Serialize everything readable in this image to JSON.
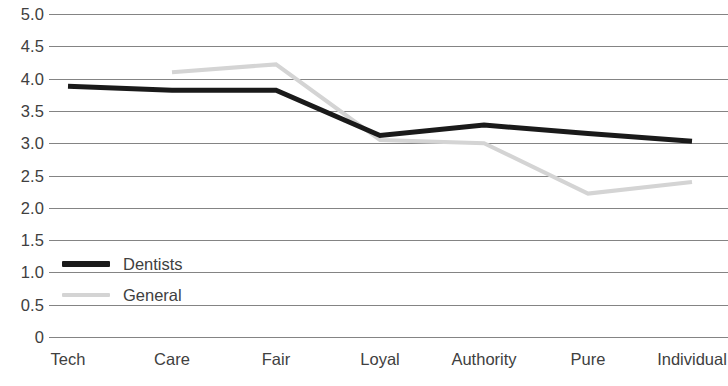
{
  "chart_data": {
    "type": "line",
    "title": "",
    "subtitle": "",
    "xlabel": "",
    "ylabel": "",
    "categories": [
      "Tech",
      "Care",
      "Fair",
      "Loyal",
      "Authority",
      "Pure",
      "Individual"
    ],
    "ylim": [
      0,
      5
    ],
    "y_ticks": [
      0,
      0.5,
      1.0,
      1.5,
      2.0,
      2.5,
      3.0,
      3.5,
      4.0,
      4.5,
      5.0
    ],
    "y_tick_labels": [
      "0",
      "0.5",
      "1.0",
      "1.5",
      "2.0",
      "2.5",
      "3.0",
      "3.5",
      "4.0",
      "4.5",
      "5.0"
    ],
    "grid": true,
    "grid_axis": "y",
    "legend_position": "inside-lower-left",
    "series": [
      {
        "name": "Dentists",
        "color": "#1a1a1a",
        "line_width": 5,
        "values": [
          3.88,
          3.82,
          3.82,
          3.12,
          3.28,
          3.15,
          3.03
        ]
      },
      {
        "name": "General",
        "color": "#d4d4d4",
        "line_width": 4,
        "values": [
          null,
          4.1,
          4.22,
          3.05,
          3.0,
          2.22,
          2.4
        ]
      }
    ]
  },
  "legend": {
    "items": [
      {
        "label": "Dentists"
      },
      {
        "label": "General"
      }
    ]
  },
  "colors": {
    "dentists_line": "#1a1a1a",
    "general_line": "#d4d4d4",
    "gridline": "#6e6e6e",
    "text": "#404040",
    "background": "#ffffff"
  }
}
